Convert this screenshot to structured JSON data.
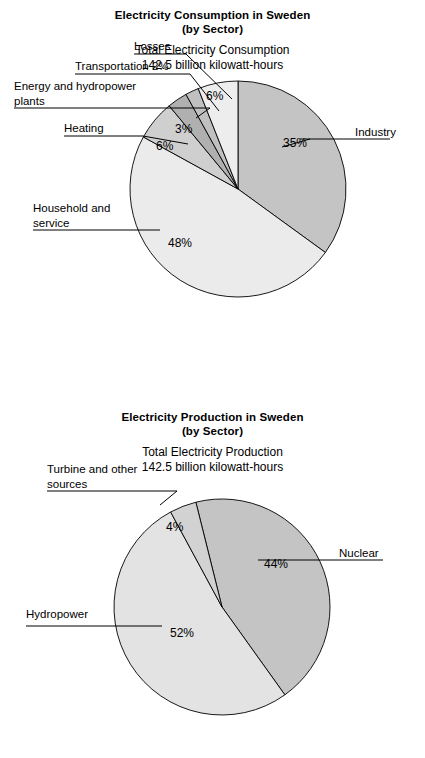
{
  "figures": [
    {
      "id": "electricity-consumption",
      "title_line1": "Electricity Consumption in Sweden",
      "title_line2": "(by Sector)",
      "subtitle_line1": "Total Electricity Consumption",
      "subtitle_line2": "142.5 billion kilowatt-hours",
      "labels": {
        "losses": "Losses",
        "transportation": "Transportation 2%",
        "energy_line1": "Energy and hydropower",
        "energy_line2": "plants",
        "heating": "Heating",
        "household_line1": "Household and",
        "household_line2": "service",
        "industry": "Industry"
      },
      "percents": {
        "losses": "6%",
        "energy": "3%",
        "heating": "6%",
        "household": "48%",
        "industry": "35%"
      }
    },
    {
      "id": "electricity-production",
      "title_line1": "Electricity Production in Sweden",
      "title_line2": "(by Sector)",
      "subtitle_line1": "Total Electricity Production",
      "subtitle_line2": "142.5 billion kilowatt-hours",
      "labels": {
        "turbine_line1": "Turbine and other",
        "turbine_line2": "sources",
        "hydropower": "Hydropower",
        "nuclear": "Nuclear"
      },
      "percents": {
        "turbine": "4%",
        "hydropower": "52%",
        "nuclear": "44%"
      }
    }
  ],
  "chart_data": [
    {
      "type": "pie",
      "title": "Electricity Consumption in Sweden (by Sector)",
      "subtitle": "Total Electricity Consumption 142.5 billion kilowatt-hours",
      "total_label": "142.5 billion kilowatt-hours",
      "total_value": 142.5,
      "units": "billion kilowatt-hours",
      "categories": [
        "Industry",
        "Household and service",
        "Heating",
        "Energy and hydropower plants",
        "Transportation",
        "Losses"
      ],
      "values": [
        35,
        48,
        6,
        3,
        2,
        6
      ],
      "value_labels": [
        "35%",
        "48%",
        "6%",
        "3%",
        "2%",
        "6%"
      ],
      "colors": [
        "#c4c4c4",
        "#ebebeb",
        "#cfcfcf",
        "#b0b0b0",
        "#c0c0c0",
        "#ededed"
      ],
      "start_angle_deg": 0,
      "direction": "clockwise",
      "legend": "none (leader-line callouts)"
    },
    {
      "type": "pie",
      "title": "Electricity Production in Sweden (by Sector)",
      "subtitle": "Total Electricity Production 142.5 billion kilowatt-hours",
      "total_label": "142.5 billion kilowatt-hours",
      "total_value": 142.5,
      "units": "billion kilowatt-hours",
      "categories": [
        "Nuclear",
        "Hydropower",
        "Turbine and other sources"
      ],
      "values": [
        44,
        52,
        4
      ],
      "value_labels": [
        "44%",
        "52%",
        "4%"
      ],
      "colors": [
        "#c4c4c4",
        "#e3e3e3",
        "#d2d2d2"
      ],
      "start_angle_deg": -14,
      "direction": "clockwise",
      "legend": "none (leader-line callouts)"
    }
  ]
}
